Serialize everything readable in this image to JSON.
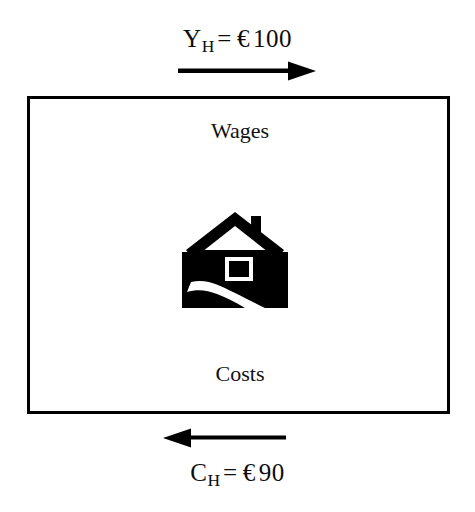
{
  "diagram": {
    "title_top": "Y_H = € 100",
    "top_flow": {
      "variable": "Y",
      "subscript": "H",
      "operator": "=",
      "currency": "€",
      "amount": "100",
      "arrow_direction": "right",
      "arrow_name": "income-arrow-right"
    },
    "bottom_flow": {
      "variable": "C",
      "subscript": "H",
      "operator": "=",
      "currency": "€",
      "amount": "90",
      "arrow_direction": "left",
      "arrow_name": "consumption-arrow-left"
    },
    "box": {
      "top_label": "Wages",
      "bottom_label": "Costs",
      "border_color": "#000000",
      "fill_color": "#ffffff"
    },
    "icon": {
      "name": "house-icon",
      "description": "house with chimney and winding path",
      "fill_color": "#000000",
      "background_color": "#ffffff"
    }
  }
}
